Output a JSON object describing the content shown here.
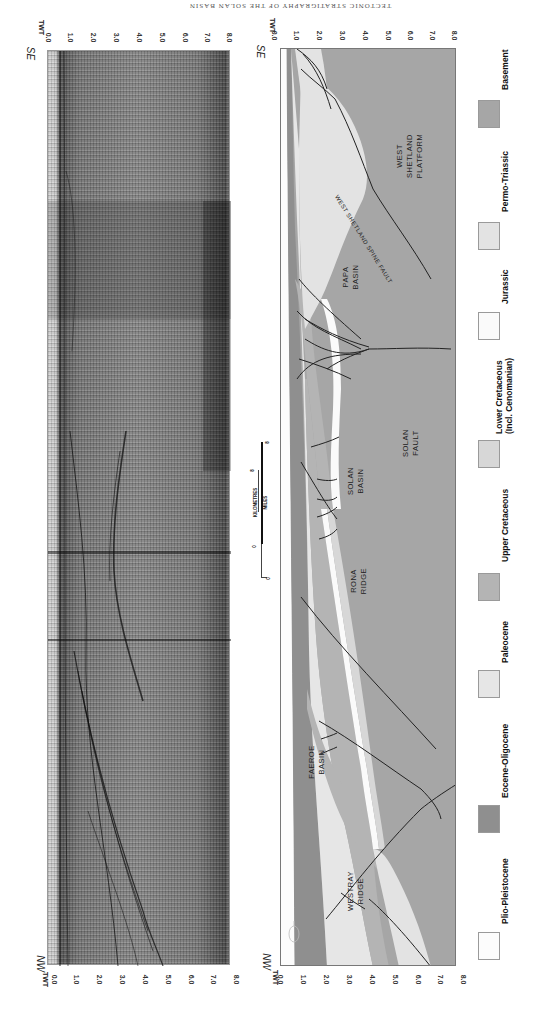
{
  "running_head": "TECTONIC STRATIGRAPHY OF THE SOLAN BASIN",
  "axis": {
    "title": "TWT",
    "ticks": [
      "0.0",
      "1.0",
      "2.0",
      "3.0",
      "4.0",
      "5.0",
      "6.0",
      "7.0",
      "8.0"
    ]
  },
  "directions": {
    "top": "SE",
    "bottom": "NW"
  },
  "seismic_panel": {
    "name": "Seismic section"
  },
  "geology_panel": {
    "labels": {
      "west_shetland_platform": [
        "WEST",
        "SHETLAND",
        "PLATFORM"
      ],
      "papa_basin": [
        "PAPA",
        "BASIN"
      ],
      "solan_basin": [
        "SOLAN",
        "BASIN"
      ],
      "solan_fault": [
        "SOLAN",
        "FAULT"
      ],
      "rona_ridge": [
        "RONA",
        "RIDGE"
      ],
      "faeroe_basin": [
        "FAEROE",
        "BASIN"
      ],
      "westray_ridge": [
        "WESTRAY",
        "RIDGE"
      ],
      "spine_fault": "WEST SHETLAND SPINE FAULT"
    }
  },
  "scale_bar": {
    "kilometres_label": "KILOMETRES",
    "miles_label": "MILES",
    "km_ticks": [
      "0",
      "8"
    ],
    "miles_ticks": [
      "0",
      "8"
    ]
  },
  "legend": [
    {
      "label": "Basement",
      "color": "#a6a6a6"
    },
    {
      "label": "Permo-Triassic",
      "color": "#e3e3e3"
    },
    {
      "label": "Jurassic",
      "color": "#fafafa"
    },
    {
      "label": "Lower Cretaceous",
      "label2": "(Incl. Cenomanian)",
      "color": "#d7d7d7"
    },
    {
      "label": "Upper Cretaceous",
      "color": "#b4b4b4"
    },
    {
      "label": "Paleocene",
      "color": "#e6e6e6"
    },
    {
      "label": "Eocene-Oligocene",
      "color": "#8f8f8f"
    },
    {
      "label": "Plio-Pleistocene",
      "color": "#fcfcfc"
    }
  ]
}
